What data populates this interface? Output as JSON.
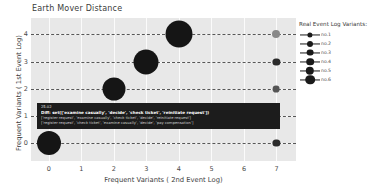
{
  "chart_data": {
    "type": "scatter",
    "title": "Earth Mover Distance",
    "xlabel": "Frequent Variants ( 2nd Event Log)",
    "ylabel": "Frequent Variants  ( 1st  Event Log)",
    "xlim": [
      -0.55,
      7.6
    ],
    "ylim": [
      -0.65,
      4.6
    ],
    "xticks": [
      "0",
      "1",
      "2",
      "3",
      "4",
      "5",
      "6",
      "7"
    ],
    "yticks": [
      "0",
      "1",
      "2",
      "3",
      "4"
    ],
    "grid": true,
    "dashed_rows": [
      0,
      1,
      2,
      3,
      4
    ],
    "legend_position": "right",
    "points": [
      {
        "x": 4,
        "y": 4,
        "size": 13.5,
        "color": "#151515"
      },
      {
        "x": 7,
        "y": 4,
        "size": 4.0,
        "color": "#888888"
      },
      {
        "x": 3,
        "y": 3,
        "size": 12.5,
        "color": "#151515"
      },
      {
        "x": 7,
        "y": 3,
        "size": 3.6,
        "color": "#2b2b2b"
      },
      {
        "x": 2,
        "y": 2,
        "size": 11.5,
        "color": "#151515"
      },
      {
        "x": 7,
        "y": 2,
        "size": 3.4,
        "color": "#555555"
      },
      {
        "x": 0,
        "y": 0,
        "size": 12.0,
        "color": "#151515"
      },
      {
        "x": 7,
        "y": 0,
        "size": 3.6,
        "color": "#2b2b2b"
      }
    ]
  },
  "legend": {
    "title": "Real Event Log Variants:",
    "items": [
      {
        "label": "no.1",
        "size": 2.6
      },
      {
        "label": "no.2",
        "size": 3.0
      },
      {
        "label": "no.3",
        "size": 3.4
      },
      {
        "label": "no.4",
        "size": 3.8
      },
      {
        "label": "no.5",
        "size": 4.2
      },
      {
        "label": "no.6",
        "size": 4.8
      }
    ]
  },
  "tooltip": {
    "value": "25.02",
    "diff": "Diff: set(['examine casually', 'decide', 'check ticket', 'reinitiate request'])",
    "line3": "['register request', 'examine casually', 'check ticket', 'decide', 'reinitiate request']",
    "line4": "['register request', 'check ticket', 'examine casually', 'decide', 'pay compensation']"
  }
}
